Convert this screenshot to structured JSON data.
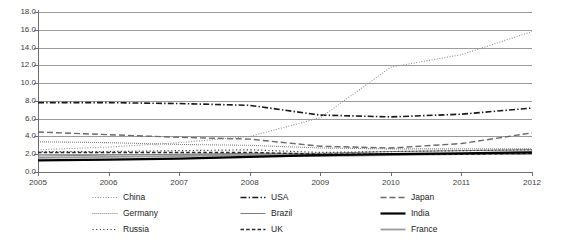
{
  "title": "",
  "axes": {
    "y_ticks": [
      "18.0",
      "16.0",
      "14.0",
      "12.0",
      "10.0",
      "8.0",
      "6.0",
      "4.0",
      "2.0",
      "0.0"
    ],
    "x_ticks": [
      "2005",
      "2006",
      "2007",
      "2008",
      "2009",
      "2010",
      "2011",
      "2012"
    ]
  },
  "legend": {
    "rows": [
      [
        {
          "label": "China",
          "style": "dotted",
          "color": "#8f8f8f",
          "width": 1.1
        },
        {
          "label": "USA",
          "style": "dashdot",
          "color": "#1a1a1a",
          "width": 1.6
        },
        {
          "label": "Japan",
          "style": "longdash",
          "color": "#6a6a6a",
          "width": 1.4
        }
      ],
      [
        {
          "label": "Germany",
          "style": "finedot",
          "color": "#5d5d5d",
          "width": 1.1
        },
        {
          "label": "Brazil",
          "style": "solid",
          "color": "#7d7d7d",
          "width": 1.0
        },
        {
          "label": "India",
          "style": "solid",
          "color": "#000000",
          "width": 2.2
        }
      ],
      [
        {
          "label": "Russia",
          "style": "sparsedot",
          "color": "#3a3a3a",
          "width": 1.2
        },
        {
          "label": "UK",
          "style": "dashed",
          "color": "#2a2a2a",
          "width": 1.4
        },
        {
          "label": "France",
          "style": "solid",
          "color": "#9a9a9a",
          "width": 1.8
        }
      ]
    ]
  },
  "chart_data": {
    "type": "line",
    "title": "",
    "xlabel": "",
    "ylabel": "",
    "x": [
      2005,
      2006,
      2007,
      2008,
      2009,
      2010,
      2011,
      2012
    ],
    "xlim": [
      2005,
      2012
    ],
    "ylim": [
      0.0,
      18.0
    ],
    "ytick_step": 2.0,
    "grid": true,
    "legend_position": "bottom",
    "series": [
      {
        "name": "China",
        "values": [
          2.5,
          2.8,
          3.3,
          4.0,
          6.1,
          11.8,
          13.2,
          15.8
        ]
      },
      {
        "name": "USA",
        "values": [
          7.8,
          7.8,
          7.7,
          7.5,
          6.4,
          6.2,
          6.5,
          7.2
        ]
      },
      {
        "name": "Japan",
        "values": [
          4.5,
          4.2,
          3.9,
          3.7,
          2.9,
          2.7,
          3.2,
          4.4
        ]
      },
      {
        "name": "Germany",
        "values": [
          3.4,
          3.3,
          3.1,
          3.0,
          2.7,
          2.6,
          2.6,
          2.6
        ]
      },
      {
        "name": "Brazil",
        "values": [
          1.8,
          1.9,
          2.0,
          2.1,
          2.1,
          2.3,
          2.4,
          2.5
        ]
      },
      {
        "name": "India",
        "values": [
          1.3,
          1.4,
          1.5,
          1.7,
          1.9,
          2.0,
          2.1,
          2.2
        ]
      },
      {
        "name": "Russia",
        "values": [
          2.3,
          2.3,
          2.4,
          2.5,
          2.2,
          2.3,
          2.4,
          2.5
        ]
      },
      {
        "name": "UK",
        "values": [
          2.2,
          2.2,
          2.2,
          2.2,
          2.0,
          2.0,
          2.0,
          2.1
        ]
      },
      {
        "name": "France",
        "values": [
          1.6,
          1.7,
          1.8,
          1.9,
          1.8,
          1.9,
          2.0,
          2.1
        ]
      }
    ]
  }
}
